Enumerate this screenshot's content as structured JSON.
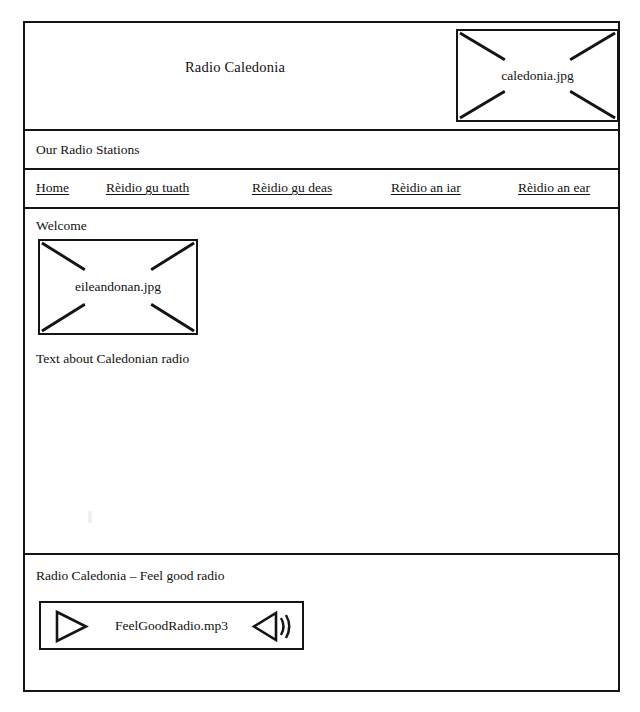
{
  "mockup": {
    "kind": "website-wireframe",
    "ink_color": "#141414",
    "page_background": "#ffffff"
  },
  "header": {
    "site_title": "Radio Caledonia",
    "image_placeholder": {
      "label": "caledonia.jpg",
      "icon": "image-placeholder-icon"
    }
  },
  "stations_bar": {
    "label": "Our Radio Stations"
  },
  "nav": {
    "items": [
      {
        "label": "Home"
      },
      {
        "label": "Rèidio gu tuath"
      },
      {
        "label": "Rèidio gu deas"
      },
      {
        "label": "Rèidio an iar"
      },
      {
        "label": "Rèidio an ear"
      }
    ]
  },
  "main": {
    "heading": "Welcome",
    "image_placeholder": {
      "label": "eileandonan.jpg",
      "icon": "image-placeholder-icon"
    },
    "body_text": "Text about Caledonian radio"
  },
  "footer": {
    "tagline": "Radio Caledonia – Feel good radio",
    "player": {
      "filename": "FeelGoodRadio.mp3",
      "play_icon": "play-triangle-icon",
      "volume_icon": "speaker-volume-icon"
    }
  }
}
